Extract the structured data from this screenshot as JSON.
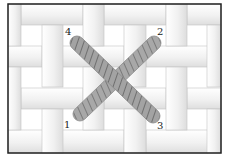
{
  "diagram": {
    "frame": {
      "x": 8,
      "y": 4,
      "width": 213,
      "height": 149,
      "stroke": "#222222"
    },
    "fabric": {
      "background": "#ffffff",
      "strip_fill": "#f3f3f3",
      "strip_shade": "#dcdcdc",
      "strip_line": "#c4c4c4",
      "horizontal_strips": [
        {
          "x": 21,
          "y": 4,
          "w": 62,
          "h": 21
        },
        {
          "x": 104,
          "y": 4,
          "w": 62,
          "h": 21
        },
        {
          "x": 187,
          "y": 4,
          "w": 34,
          "h": 21
        },
        {
          "x": 8,
          "y": 46,
          "w": 34,
          "h": 21
        },
        {
          "x": 62,
          "y": 46,
          "w": 62,
          "h": 21
        },
        {
          "x": 146,
          "y": 46,
          "w": 62,
          "h": 21
        },
        {
          "x": 21,
          "y": 88,
          "w": 62,
          "h": 21
        },
        {
          "x": 104,
          "y": 88,
          "w": 62,
          "h": 21
        },
        {
          "x": 187,
          "y": 88,
          "w": 34,
          "h": 21
        },
        {
          "x": 8,
          "y": 130,
          "w": 54,
          "h": 23
        },
        {
          "x": 62,
          "y": 130,
          "w": 62,
          "h": 23
        },
        {
          "x": 146,
          "y": 130,
          "w": 62,
          "h": 23
        }
      ],
      "vertical_strips": [
        {
          "x": 8,
          "y": 4,
          "w": 13,
          "h": 42
        },
        {
          "x": 42,
          "y": 25,
          "w": 21,
          "h": 62
        },
        {
          "x": 83,
          "y": 4,
          "w": 21,
          "h": 42
        },
        {
          "x": 124,
          "y": 25,
          "w": 22,
          "h": 62
        },
        {
          "x": 166,
          "y": 4,
          "w": 21,
          "h": 42
        },
        {
          "x": 207,
          "y": 25,
          "w": 14,
          "h": 62
        },
        {
          "x": 8,
          "y": 67,
          "w": 13,
          "h": 63
        },
        {
          "x": 83,
          "y": 67,
          "w": 21,
          "h": 63
        },
        {
          "x": 166,
          "y": 67,
          "w": 21,
          "h": 63
        },
        {
          "x": 42,
          "y": 109,
          "w": 21,
          "h": 44
        },
        {
          "x": 124,
          "y": 109,
          "w": 22,
          "h": 44
        },
        {
          "x": 207,
          "y": 109,
          "w": 14,
          "h": 44
        }
      ]
    },
    "stitches": [
      {
        "name": "stitch-1-to-2",
        "from": {
          "x": 80,
          "y": 114
        },
        "to": {
          "x": 154,
          "y": 43
        },
        "width": 14,
        "fill": "#a9a9a9",
        "stripe": "#7c7c7c",
        "stroke": "#8f8f8f"
      },
      {
        "name": "stitch-4-to-3",
        "from": {
          "x": 77,
          "y": 43
        },
        "to": {
          "x": 153,
          "y": 116
        },
        "width": 14,
        "fill": "#a4a4a4",
        "stripe": "#737373",
        "stroke": "#8a8a8a"
      }
    ],
    "labels": [
      {
        "id": "label-1",
        "text": "1",
        "x": 64,
        "y": 120
      },
      {
        "id": "label-2",
        "text": "2",
        "x": 157,
        "y": 27
      },
      {
        "id": "label-3",
        "text": "3",
        "x": 157,
        "y": 121
      },
      {
        "id": "label-4",
        "text": "4",
        "x": 65,
        "y": 27
      }
    ]
  }
}
